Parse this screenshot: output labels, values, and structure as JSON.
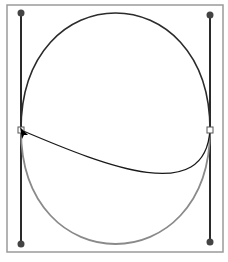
{
  "diagram": {
    "type": "bezier-path-editing",
    "frame": {
      "x": 7,
      "y": 5,
      "width": 216,
      "height": 247,
      "stroke": "#9a9a9a"
    },
    "colors": {
      "handle_line": "#2a2a2a",
      "handle_point": "#444444",
      "upper_curve": "#2b2b2b",
      "lower_curve": "#8a8a8a",
      "inner_curve": "#1a1a1a",
      "anchor_fill": "#ffffff",
      "anchor_stroke": "#555555",
      "cursor": "#000000"
    },
    "anchors": [
      {
        "name": "left-anchor",
        "x": 21,
        "y": 130
      },
      {
        "name": "right-anchor",
        "x": 210,
        "y": 130
      }
    ],
    "handles": [
      {
        "name": "left-top-handle",
        "x1": 21,
        "y1": 130,
        "x2": 21,
        "y2": 13
      },
      {
        "name": "left-bottom-handle",
        "x1": 21,
        "y1": 130,
        "x2": 21,
        "y2": 244
      },
      {
        "name": "right-top-handle",
        "x1": 210,
        "y1": 130,
        "x2": 210,
        "y2": 15
      },
      {
        "name": "right-bottom-handle",
        "x1": 210,
        "y1": 130,
        "x2": 210,
        "y2": 242
      }
    ],
    "curves": {
      "upper": "M21,130 C21,-26 210,-26 210,130",
      "lower": "M21,130 C21,282 210,282 210,130",
      "inner": "M21,130 C110,168 205,205 210,130"
    },
    "cursor": {
      "x": 20,
      "y": 127
    }
  }
}
